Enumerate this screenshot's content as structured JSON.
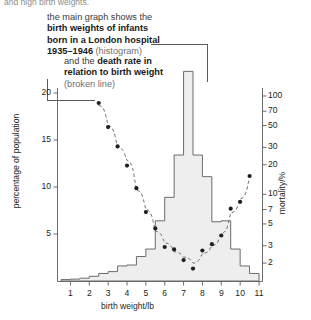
{
  "page": {
    "truncated_top_line": "and high birth weights."
  },
  "callouts": {
    "histogram": {
      "line1": "the main graph shows the",
      "line2_bold": "birth weights of infants",
      "line3_bold": "born in a London hospital",
      "line4_bold": "1935–1946",
      "line4_rest": "(histogram)"
    },
    "line": {
      "line1_pre": "and the ",
      "line1_bold": "death rate in",
      "line2_bold": "relation to birth weight",
      "line3": "(broken line)"
    }
  },
  "chart_data": {
    "type": "bar",
    "title": "",
    "xlabel": "birth weight/lb",
    "ylabel": "percentage of population",
    "y2label": "mortality/%",
    "xlim": [
      0.5,
      11.0
    ],
    "ylim": [
      0,
      23.5
    ],
    "xticks": [
      1,
      2,
      3,
      4,
      5,
      6,
      7,
      8,
      9,
      10,
      11
    ],
    "yticks": [
      5,
      10,
      15,
      20
    ],
    "y2ticks": [
      2,
      3,
      5,
      7,
      10,
      20,
      30,
      50,
      70,
      100
    ],
    "y2scale": "log",
    "y2lim": [
      1.7,
      115
    ],
    "grid": false,
    "legend": "none",
    "series": [
      {
        "name": "birth weights of infants born in a London hospital 1935–1946",
        "type": "histogram",
        "bin_width": 0.5,
        "bin_starts": [
          0.5,
          1.0,
          1.5,
          2.0,
          2.5,
          3.0,
          3.5,
          4.0,
          4.5,
          5.0,
          5.5,
          6.0,
          6.5,
          7.0,
          7.5,
          8.0,
          8.5,
          9.0,
          9.5,
          10.0,
          10.5
        ],
        "values": [
          0.15,
          0.2,
          0.3,
          0.5,
          0.8,
          1.0,
          1.6,
          1.7,
          2.6,
          3.4,
          6.4,
          8.9,
          13.4,
          22.3,
          13.4,
          11.1,
          6.3,
          6.4,
          3.4,
          1.6,
          0.8
        ]
      },
      {
        "name": "death rate in relation to birth weight",
        "type": "scatter-line",
        "style": "broken line",
        "x": [
          2.5,
          3.0,
          3.5,
          4.0,
          4.5,
          5.0,
          5.5,
          6.0,
          6.5,
          7.0,
          7.5,
          8.0,
          8.5,
          9.0,
          9.5,
          10.0,
          10.5
        ],
        "y": [
          80.0,
          50.0,
          30.0,
          22.0,
          11.0,
          7.0,
          4.2,
          3.2,
          2.6,
          2.3,
          2.0,
          2.5,
          3.0,
          4.0,
          6.5,
          9.0,
          15.0
        ]
      }
    ]
  },
  "colors": {
    "histogram_fill": "#eeeeee",
    "histogram_stroke": "#6b6b6b",
    "line_stroke": "#6b6b6b",
    "point_fill": "#231f20",
    "axis": "#6b6b6b",
    "text": "#231f20",
    "muted_text": "#8d8d8d"
  }
}
